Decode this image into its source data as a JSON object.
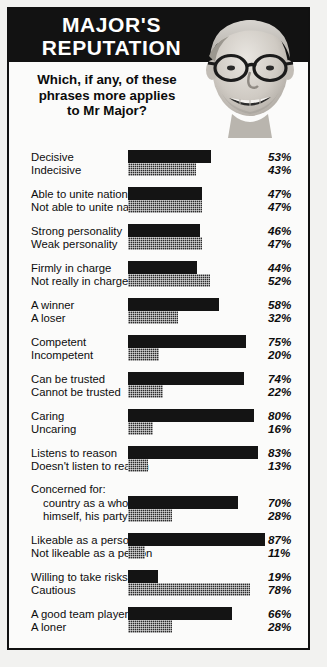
{
  "header": {
    "title": "MAJOR'S\nREPUTATION",
    "question": "Which, if any, of these\nphrases more applies\nto Mr Major?",
    "photo_alt": "john-major-portrait"
  },
  "colors": {
    "banner_background": "#121212",
    "banner_text": "#ffffff",
    "bar_positive": "#141414",
    "bar_negative": "#2b2b2b",
    "page_background": "#fbfbfa",
    "frame_border": "#111111",
    "text": "#0d0d0d"
  },
  "chart_data": {
    "type": "bar",
    "title": "MAJOR'S REPUTATION",
    "subtitle": "Which, if any, of these phrases more applies to Mr Major?",
    "xlabel": "",
    "ylabel": "",
    "xlim": [
      0,
      100
    ],
    "grid": false,
    "legend": "none",
    "orientation": "horizontal",
    "value_suffix": "%",
    "series": [
      {
        "name": "positive phrase",
        "style": "solid"
      },
      {
        "name": "negative phrase",
        "style": "hatched"
      }
    ],
    "groups": [
      {
        "group_label": "",
        "pairs": [
          {
            "label": "Decisive",
            "value": 53,
            "display": "53%",
            "style": "solid"
          },
          {
            "label": "Indecisive",
            "value": 43,
            "display": "43%",
            "style": "hatched"
          }
        ]
      },
      {
        "group_label": "",
        "pairs": [
          {
            "label": "Able to unite nation",
            "value": 47,
            "display": "47%",
            "style": "solid"
          },
          {
            "label": "Not able to unite nation",
            "value": 47,
            "display": "47%",
            "style": "hatched"
          }
        ]
      },
      {
        "group_label": "",
        "pairs": [
          {
            "label": "Strong personality",
            "value": 46,
            "display": "46%",
            "style": "solid"
          },
          {
            "label": "Weak personality",
            "value": 47,
            "display": "47%",
            "style": "hatched"
          }
        ]
      },
      {
        "group_label": "",
        "pairs": [
          {
            "label": "Firmly in charge",
            "value": 44,
            "display": "44%",
            "style": "solid"
          },
          {
            "label": "Not really in charge",
            "value": 52,
            "display": "52%",
            "style": "hatched"
          }
        ]
      },
      {
        "group_label": "",
        "pairs": [
          {
            "label": "A winner",
            "value": 58,
            "display": "58%",
            "style": "solid"
          },
          {
            "label": "A loser",
            "value": 32,
            "display": "32%",
            "style": "hatched"
          }
        ]
      },
      {
        "group_label": "",
        "pairs": [
          {
            "label": "Competent",
            "value": 75,
            "display": "75%",
            "style": "solid"
          },
          {
            "label": "Incompetent",
            "value": 20,
            "display": "20%",
            "style": "hatched"
          }
        ]
      },
      {
        "group_label": "",
        "pairs": [
          {
            "label": "Can be trusted",
            "value": 74,
            "display": "74%",
            "style": "solid"
          },
          {
            "label": "Cannot be trusted",
            "value": 22,
            "display": "22%",
            "style": "hatched"
          }
        ]
      },
      {
        "group_label": "",
        "pairs": [
          {
            "label": "Caring",
            "value": 80,
            "display": "80%",
            "style": "solid"
          },
          {
            "label": "Uncaring",
            "value": 16,
            "display": "16%",
            "style": "hatched"
          }
        ]
      },
      {
        "group_label": "",
        "pairs": [
          {
            "label": "Listens to reason",
            "value": 83,
            "display": "83%",
            "style": "solid"
          },
          {
            "label": "Doesn't listen to reason",
            "value": 13,
            "display": "13%",
            "style": "hatched"
          }
        ]
      },
      {
        "group_label": "Concerned for:",
        "pairs": [
          {
            "label": "country as a whole",
            "value": 70,
            "display": "70%",
            "style": "solid",
            "indent": true
          },
          {
            "label": "himself, his party",
            "value": 28,
            "display": "28%",
            "style": "hatched",
            "indent": true
          }
        ]
      },
      {
        "group_label": "",
        "pairs": [
          {
            "label": "Likeable as a person",
            "value": 87,
            "display": "87%",
            "style": "solid"
          },
          {
            "label": "Not likeable as a person",
            "value": 11,
            "display": "11%",
            "style": "hatched"
          }
        ]
      },
      {
        "group_label": "",
        "pairs": [
          {
            "label": "Willing to take risks",
            "value": 19,
            "display": "19%",
            "style": "solid"
          },
          {
            "label": "Cautious",
            "value": 78,
            "display": "78%",
            "style": "hatched"
          }
        ]
      },
      {
        "group_label": "",
        "pairs": [
          {
            "label": "A good team player",
            "value": 66,
            "display": "66%",
            "style": "solid"
          },
          {
            "label": "A loner",
            "value": 28,
            "display": "28%",
            "style": "hatched"
          }
        ]
      }
    ]
  }
}
